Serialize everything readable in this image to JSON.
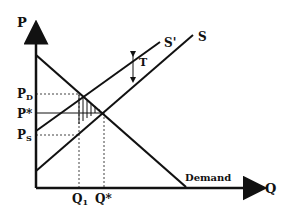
{
  "diagram": {
    "axes": {
      "y_label": "P",
      "x_label": "Q"
    },
    "curves": {
      "supply": "S",
      "supply_shifted": "S'",
      "demand": "Demand"
    },
    "price_labels": {
      "pd_main": "P",
      "pd_sub": "D",
      "p_star": "P*",
      "ps_main": "P",
      "ps_sub": "S"
    },
    "quantity_labels": {
      "q1_main": "Q",
      "q1_sub": "1",
      "q_star": "Q*"
    },
    "tax_label": "T",
    "colors": {
      "ink": "#111111",
      "background": "#ffffff"
    }
  }
}
